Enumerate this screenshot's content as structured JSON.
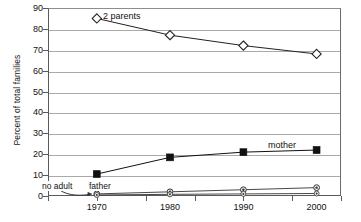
{
  "chart_data": {
    "type": "line",
    "title": "",
    "xlabel": "",
    "ylabel": "Percent of total families",
    "categories": [
      "1970",
      "1980",
      "1990",
      "2000"
    ],
    "x": [
      1970,
      1980,
      1990,
      2000
    ],
    "xlim": [
      1967,
      2003
    ],
    "ylim": [
      0,
      90
    ],
    "yticks": [
      "0",
      "10",
      "20",
      "30",
      "40",
      "50",
      "60",
      "70",
      "80",
      "90"
    ],
    "ytick_values": [
      0,
      10,
      20,
      30,
      40,
      50,
      60,
      70,
      80,
      90
    ],
    "grid": true,
    "legend": "inline-annotations",
    "series": [
      {
        "name": "2 parents",
        "marker": "open-diamond",
        "color": "#222222",
        "values": [
          85,
          77,
          72,
          68
        ]
      },
      {
        "name": "mother",
        "marker": "filled-square",
        "color": "#111111",
        "values": [
          10.5,
          18.5,
          21,
          22
        ]
      },
      {
        "name": "father",
        "marker": "small-circle",
        "color": "#333333",
        "values": [
          1,
          2,
          3,
          4
        ]
      },
      {
        "name": "no adult",
        "marker": "small-circle",
        "color": "#333333",
        "values": [
          0.5,
          0.8,
          1,
          1.2
        ]
      }
    ],
    "annotations": [
      {
        "text": "2 parents",
        "target_series": "2 parents"
      },
      {
        "text": "mother",
        "target_series": "mother"
      },
      {
        "text": "father",
        "target_series": "father"
      },
      {
        "text": "no adult",
        "target_series": "no adult",
        "arrow": true
      }
    ]
  },
  "labels": {
    "y_axis_title": "Percent of total families",
    "series_2parents": "2 parents",
    "series_mother": "mother",
    "series_father": "father",
    "series_noadult": "no adult",
    "ytick_90": "90",
    "ytick_80": "80",
    "ytick_70": "70",
    "ytick_60": "60",
    "ytick_50": "50",
    "ytick_40": "40",
    "ytick_30": "30",
    "ytick_20": "20",
    "ytick_10": "10",
    "ytick_0": "0",
    "xtick_1970": "1970",
    "xtick_1980": "1980",
    "xtick_1990": "1990",
    "xtick_2000": "2000"
  },
  "colors": {
    "axis": "#5a5a5a",
    "grid": "#a9a9a9",
    "line": "#222222",
    "marker_fill_open": "#ffffff",
    "marker_fill_solid": "#111111",
    "background": "#ffffff"
  }
}
